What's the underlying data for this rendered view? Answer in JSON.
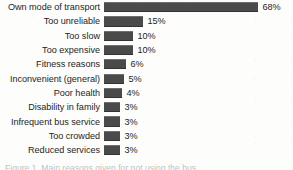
{
  "chart_data": {
    "type": "bar",
    "orientation": "horizontal",
    "title": "",
    "subtitle": "",
    "xlabel": "",
    "ylabel": "",
    "grid": false,
    "legend": null,
    "legend_position": "none",
    "axis_visible": false,
    "value_suffix": "%",
    "xlim": [
      0,
      68
    ],
    "bar_color": "#4a4a4a",
    "background_color": "#fdfdfc",
    "text_color": "#1d1d1d",
    "categories": [
      "Own mode of transport",
      "Too unreliable",
      "Too slow",
      "Too expensive",
      "Fitness reasons",
      "Inconvenient (general)",
      "Poor health",
      "Disability in family",
      "Infrequent bus service",
      "Too crowded",
      "Reduced services"
    ],
    "values": [
      68,
      15,
      10,
      10,
      6,
      5,
      4,
      3,
      3,
      3,
      3
    ],
    "value_labels": [
      "68%",
      "15%",
      "10%",
      "10%",
      "6%",
      "5%",
      "4%",
      "3%",
      "3%",
      "3%",
      "3%"
    ],
    "bars": [
      {
        "label": "Own mode of transport",
        "value": 68,
        "value_label": "68%",
        "bar_px": 154
      },
      {
        "label": "Too unreliable",
        "value": 15,
        "value_label": "15%",
        "bar_px": 39
      },
      {
        "label": "Too slow",
        "value": 10,
        "value_label": "10%",
        "bar_px": 29
      },
      {
        "label": "Too expensive",
        "value": 10,
        "value_label": "10%",
        "bar_px": 29
      },
      {
        "label": "Fitness reasons",
        "value": 6,
        "value_label": "6%",
        "bar_px": 22
      },
      {
        "label": "Inconvenient (general)",
        "value": 5,
        "value_label": "5%",
        "bar_px": 20
      },
      {
        "label": "Poor health",
        "value": 4,
        "value_label": "4%",
        "bar_px": 18
      },
      {
        "label": "Disability in family",
        "value": 3,
        "value_label": "3%",
        "bar_px": 16
      },
      {
        "label": "Infrequent bus service",
        "value": 3,
        "value_label": "3%",
        "bar_px": 16
      },
      {
        "label": "Too crowded",
        "value": 3,
        "value_label": "3%",
        "bar_px": 16
      },
      {
        "label": "Reduced services",
        "value": 3,
        "value_label": "3%",
        "bar_px": 16
      }
    ]
  },
  "caption": {
    "clipped_text": "Figure 1. Main reasons given for not using the bus"
  }
}
